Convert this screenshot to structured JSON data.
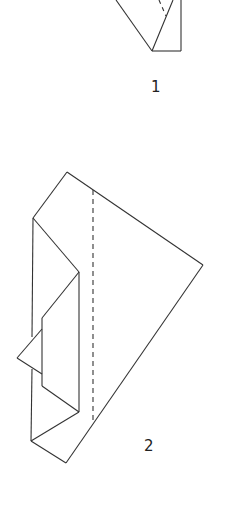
{
  "figures": [
    {
      "id": "fig-1",
      "label": "1"
    },
    {
      "id": "fig-2",
      "label": "2"
    }
  ],
  "colors": {
    "stroke": "#333333",
    "background": "#ffffff"
  }
}
